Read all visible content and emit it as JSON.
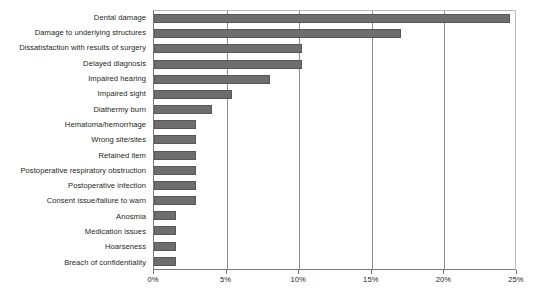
{
  "chart_data": {
    "type": "bar",
    "orientation": "horizontal",
    "title": "",
    "subtitle": "",
    "xlabel": "",
    "ylabel": "",
    "xlim": [
      0,
      25
    ],
    "xtick_values": [
      0,
      5,
      10,
      15,
      20,
      25
    ],
    "xtick_labels": [
      "0%",
      "5%",
      "10%",
      "15%",
      "20%",
      "25%"
    ],
    "grid": true,
    "grid_axis": "x",
    "legend": false,
    "legend_position": "none",
    "bar_color": "#6e6e6e",
    "categories": [
      "Dental damage",
      "Damage to underlying structures",
      "Dissatisfaction with results of surgery",
      "Delayed diagnosis",
      "Impaired hearing",
      "Impaired sight",
      "Diathermy burn",
      "Hematoma/hemorrhage",
      "Wrong site/sites",
      "Retained item",
      "Postoperative respiratory obstruction",
      "Postoperative infection",
      "Consent issue/failure to warn",
      "Anosmia",
      "Medication issues",
      "Hoarseness",
      "Breach of confidentiality"
    ],
    "values": [
      24.5,
      17.0,
      10.2,
      10.2,
      8.0,
      5.4,
      4.0,
      2.9,
      2.9,
      2.9,
      2.9,
      2.9,
      2.9,
      1.5,
      1.5,
      1.5,
      1.5
    ],
    "value_unit": "%"
  }
}
